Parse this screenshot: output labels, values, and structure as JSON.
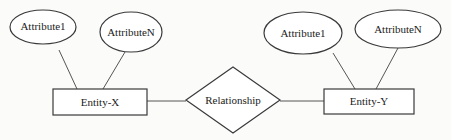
{
  "diagram": {
    "type": "er-diagram",
    "entities": [
      {
        "id": "entity-x",
        "label": "Entity-X",
        "x": 53,
        "y": 89,
        "w": 94,
        "h": 26
      },
      {
        "id": "entity-y",
        "label": "Entity-Y",
        "x": 324,
        "y": 89,
        "w": 90,
        "h": 25
      }
    ],
    "relationship": {
      "label": "Relationship",
      "cx": 233,
      "cy": 100,
      "halfW": 47,
      "halfH": 33
    },
    "attributes": [
      {
        "id": "x-attr-1",
        "entity": "entity-x",
        "label": "Attribute1",
        "cx": 43,
        "cy": 27,
        "rx": 33,
        "ry": 17
      },
      {
        "id": "x-attr-n",
        "entity": "entity-x",
        "label": "AttributeN",
        "cx": 131,
        "cy": 32,
        "rx": 31,
        "ry": 20
      },
      {
        "id": "y-attr-1",
        "entity": "entity-y",
        "label": "Attribute1",
        "cx": 303,
        "cy": 33,
        "rx": 39,
        "ry": 21
      },
      {
        "id": "y-attr-n",
        "entity": "entity-y",
        "label": "AttributeN",
        "cx": 398,
        "cy": 29,
        "rx": 43,
        "ry": 19
      }
    ],
    "edges": [
      {
        "from": "x-attr-1",
        "to": "entity-x",
        "x1": 59,
        "y1": 50,
        "x2": 77,
        "y2": 89
      },
      {
        "from": "x-attr-n",
        "to": "entity-x",
        "x1": 125,
        "y1": 52,
        "x2": 103,
        "y2": 89
      },
      {
        "from": "entity-x",
        "to": "relationship",
        "x1": 147,
        "y1": 101,
        "x2": 186,
        "y2": 101
      },
      {
        "from": "relationship",
        "to": "entity-y",
        "x1": 280,
        "y1": 101,
        "x2": 324,
        "y2": 101
      },
      {
        "from": "y-attr-1",
        "to": "entity-y",
        "x1": 333,
        "y1": 50,
        "x2": 355,
        "y2": 89
      },
      {
        "from": "y-attr-n",
        "to": "entity-y",
        "x1": 398,
        "y1": 50,
        "x2": 376,
        "y2": 89
      }
    ]
  }
}
